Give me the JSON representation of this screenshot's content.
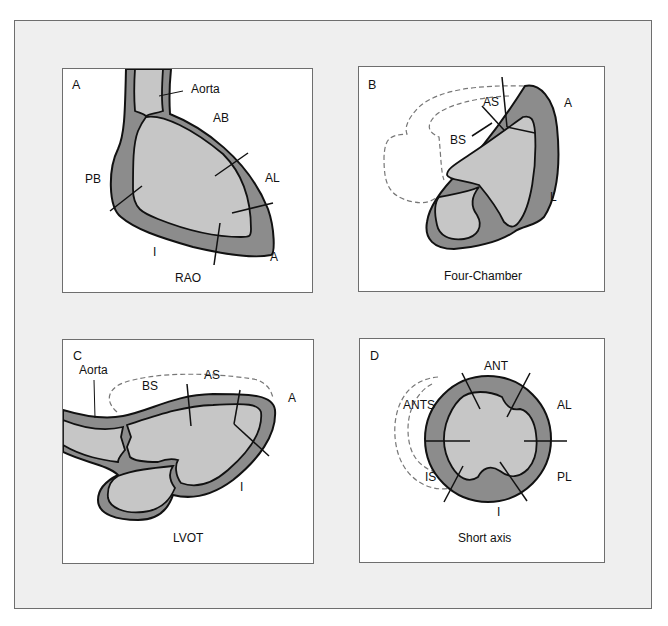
{
  "figure": {
    "colors": {
      "background": "#efefef",
      "panel": "#ffffff",
      "wall": "#8c8c8c",
      "cavity": "#c6c6c6",
      "stroke": "#111111",
      "dashed": "#777777"
    },
    "panels": [
      {
        "letter": "A",
        "view": "RAO",
        "labels": {
          "aorta": "Aorta",
          "ab": "AB",
          "al": "AL",
          "pb": "PB",
          "i": "I",
          "a": "A"
        }
      },
      {
        "letter": "B",
        "view": "Four-Chamber",
        "labels": {
          "as": "AS",
          "a": "A",
          "bs": "BS",
          "l": "L"
        }
      },
      {
        "letter": "C",
        "view": "LVOT",
        "labels": {
          "aorta": "Aorta",
          "bs": "BS",
          "as": "AS",
          "a": "A",
          "i": "I"
        }
      },
      {
        "letter": "D",
        "view": "Short axis",
        "labels": {
          "ant": "ANT",
          "ants": "ANTS",
          "al": "AL",
          "is": "IS",
          "pl": "PL",
          "i": "I"
        }
      }
    ]
  }
}
